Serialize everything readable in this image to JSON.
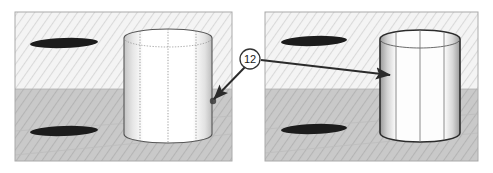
{
  "figure": {
    "panel_count": 2,
    "callout": {
      "label": "12",
      "shape": "circle"
    },
    "colors": {
      "panel_upper_band": "#f2f2f2",
      "panel_lower_band": "#c9c9c9",
      "hatch_line": "#d8d8d8",
      "panel_border": "#a8a8a8",
      "ellipse_fill": "#1c1c1c",
      "cylinder_face": "#ffffff",
      "cylinder_outline_left": "#555555",
      "cylinder_outline_right": "#2b2b2b",
      "cylinder_hidden_line": "#6b6b6b",
      "leader_line": "#2b2b2b",
      "callout_fill": "#ffffff",
      "callout_stroke": "#333333",
      "ground_line": "#bdbdbd"
    },
    "panels": [
      {
        "name": "left-panel",
        "state": "before",
        "x": 15,
        "y": 12,
        "width": 217,
        "height": 149,
        "horizon_y": 89,
        "cylinder": {
          "name": "left-cylinder",
          "style": "construction",
          "hidden_lines": true,
          "x": 124,
          "y": 31,
          "width": 88,
          "height": 110
        },
        "ellipses": [
          {
            "name": "upper-ellipse",
            "cx": 64,
            "cy": 43,
            "rx": 34,
            "ry": 5,
            "angle": -2
          },
          {
            "name": "lower-ellipse",
            "cx": 64,
            "cy": 131,
            "rx": 34,
            "ry": 5,
            "angle": -2
          }
        ]
      },
      {
        "name": "right-panel",
        "state": "after",
        "x": 265,
        "y": 12,
        "width": 213,
        "height": 149,
        "horizon_y": 89,
        "cylinder": {
          "name": "right-cylinder",
          "style": "solid",
          "hidden_lines": false,
          "x": 380,
          "y": 31,
          "width": 80,
          "height": 110
        },
        "ellipses": [
          {
            "name": "upper-ellipse",
            "cx": 314,
            "cy": 41,
            "rx": 33,
            "ry": 5,
            "angle": -2
          },
          {
            "name": "lower-ellipse",
            "cx": 314,
            "cy": 129,
            "rx": 33,
            "ry": 5,
            "angle": -2
          }
        ]
      }
    ],
    "leaders": [
      {
        "name": "leader-to-left-cylinder",
        "from_x": 245,
        "from_y": 68,
        "to_x": 212,
        "to_y": 100
      },
      {
        "name": "leader-to-right-cylinder",
        "from_x": 262,
        "from_y": 59,
        "to_x": 392,
        "to_y": 75
      }
    ]
  }
}
